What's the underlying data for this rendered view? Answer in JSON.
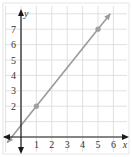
{
  "chart_data": {
    "type": "line",
    "title": "",
    "xlabel": "x",
    "ylabel": "y",
    "xlim": [
      -1,
      6.5
    ],
    "ylim": [
      -0.6,
      7.8
    ],
    "grid": true,
    "x_ticks": [
      "1",
      "2",
      "3",
      "4",
      "5",
      "6"
    ],
    "y_ticks": [
      "2",
      "3",
      "4",
      "5",
      "6",
      "7"
    ],
    "x_tick_values": [
      1,
      2,
      3,
      4,
      5,
      6
    ],
    "y_tick_values": [
      2,
      3,
      4,
      5,
      6,
      7
    ],
    "series": [
      {
        "name": "line",
        "color": "#9a9a9a",
        "slope": 1.25,
        "intercept": 0.75,
        "x_range": [
          -0.9,
          5.8
        ],
        "points": [
          {
            "x": 1,
            "y": 2
          },
          {
            "x": 5,
            "y": 7
          }
        ]
      }
    ],
    "colors": {
      "axis": "#1a1a1a",
      "grid": "#d9d9d9",
      "point": "#a0a0a0"
    }
  }
}
